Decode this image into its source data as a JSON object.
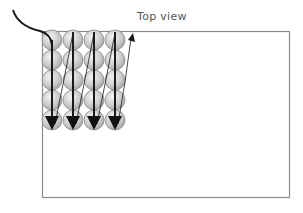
{
  "diagram": {
    "title": "Top view",
    "rows": 5,
    "columns": 4,
    "colors": {
      "frame": "#8a8a8a",
      "path": "#1a1a1a",
      "circle_fill": "#d0d0d0",
      "circle_stroke": "#888888",
      "title_text": "#555555"
    }
  }
}
